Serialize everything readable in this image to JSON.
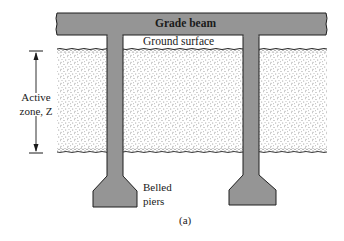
{
  "figure": {
    "caption": "(a)",
    "labels": {
      "grade_beam": "Grade beam",
      "ground_surface": "Ground surface",
      "active_zone_line1": "Active",
      "active_zone_line2": "zone, Z",
      "belled_piers_line1": "Belled",
      "belled_piers_line2": "piers"
    },
    "colors": {
      "concrete_fill": "#959595",
      "outline": "#1e1e1e",
      "soil_dots": "#3a3a3a",
      "background": "#ffffff"
    },
    "components": {
      "grade_beam": {
        "x": 56,
        "y": 13,
        "width": 271,
        "height": 22
      },
      "piers": [
        {
          "name": "left",
          "shaft_x": 107,
          "shaft_width": 16,
          "bell_x": 93,
          "bell_width": 44,
          "bell_bottom": 207
        },
        {
          "name": "right",
          "shaft_x": 243,
          "shaft_width": 16,
          "bell_x": 229,
          "bell_width": 47,
          "bell_bottom": 205
        }
      ],
      "soil_layer": {
        "x": 57,
        "top": 49,
        "bottom": 152,
        "right": 327
      },
      "active_zone_dimension": {
        "x": 36,
        "top": 51,
        "bottom": 153
      }
    }
  }
}
